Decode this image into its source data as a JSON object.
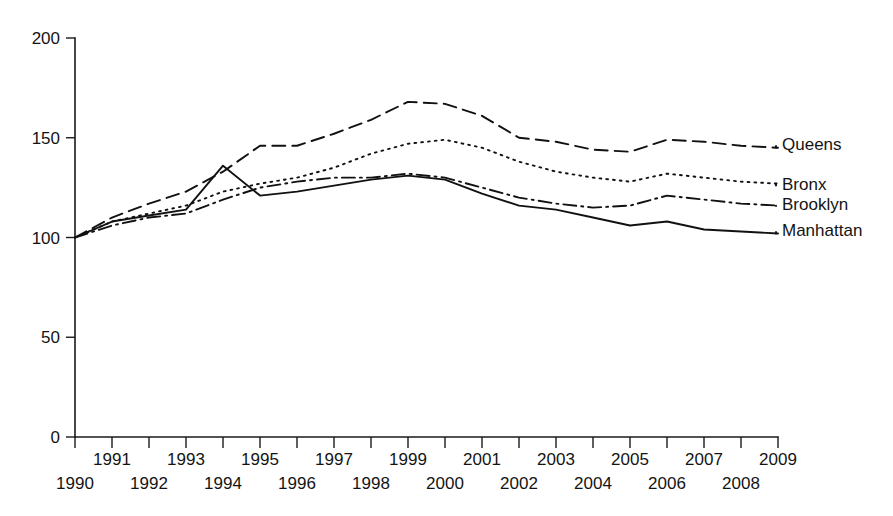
{
  "chart_data": {
    "type": "line",
    "title": "",
    "subtitle": "",
    "xlabel": "",
    "ylabel": "",
    "xlim": [
      1990,
      2009
    ],
    "ylim": [
      0,
      200
    ],
    "grid": false,
    "legend_position": "right-inline",
    "x": [
      1990,
      1991,
      1992,
      1993,
      1994,
      1995,
      1996,
      1997,
      1998,
      1999,
      2000,
      2001,
      2002,
      2003,
      2004,
      2005,
      2006,
      2007,
      2008,
      2009
    ],
    "x_tick_labels": [
      "1990",
      "1991",
      "1992",
      "1993",
      "1994",
      "1995",
      "1996",
      "1997",
      "1998",
      "1999",
      "2000",
      "2001",
      "2002",
      "2003",
      "2004",
      "2005",
      "2006",
      "2007",
      "2008",
      "2009"
    ],
    "y_ticks": [
      0,
      50,
      100,
      150,
      200
    ],
    "y_tick_labels": [
      "0",
      "50",
      "100",
      "150",
      "200"
    ],
    "series": [
      {
        "name": "Queens",
        "dash": "dashed",
        "color": "#111111",
        "values": [
          100,
          110,
          117,
          123,
          133,
          146,
          146,
          152,
          159,
          168,
          167,
          161,
          150,
          148,
          144,
          143,
          149,
          148,
          146,
          145
        ]
      },
      {
        "name": "Bronx",
        "dash": "dotted",
        "color": "#111111",
        "values": [
          100,
          108,
          112,
          116,
          123,
          127,
          130,
          135,
          142,
          147,
          149,
          145,
          138,
          133,
          130,
          128,
          132,
          130,
          128,
          127
        ]
      },
      {
        "name": "Brooklyn",
        "dash": "dashdot",
        "color": "#111111",
        "values": [
          100,
          106,
          110,
          112,
          119,
          125,
          128,
          130,
          130,
          132,
          130,
          125,
          120,
          117,
          115,
          116,
          121,
          119,
          117,
          116
        ]
      },
      {
        "name": "Manhattan",
        "dash": "solid",
        "color": "#111111",
        "values": [
          100,
          108,
          111,
          114,
          136,
          121,
          123,
          126,
          129,
          131,
          129,
          122,
          116,
          114,
          110,
          106,
          108,
          104,
          103,
          102
        ]
      }
    ]
  },
  "legend": {
    "items": [
      {
        "label": "Queens"
      },
      {
        "label": "Bronx"
      },
      {
        "label": "Brooklyn"
      },
      {
        "label": "Manhattan"
      }
    ]
  }
}
